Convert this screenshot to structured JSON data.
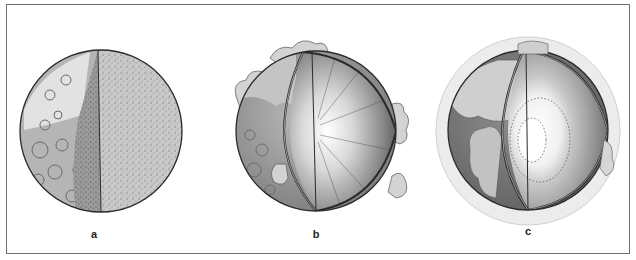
{
  "figure": {
    "panels": [
      {
        "id": "a",
        "label": "a",
        "description": "sphere with cratered surface, cut away to show uniform speckled interior"
      },
      {
        "id": "b",
        "label": "b",
        "description": "sphere with cloud-like surface patches, cut away to show radial interior with bright center"
      },
      {
        "id": "c",
        "label": "c",
        "description": "sphere within pale halo, cut away to show layered interior with distinct bright core"
      }
    ]
  },
  "colors": {
    "frame": "#6e6e6e",
    "outline": "#2a2a2a",
    "surface_light": "#d9d9d9",
    "surface_mid": "#a8a8a8",
    "surface_dark": "#6f6f6f",
    "halo": "#ececec"
  }
}
